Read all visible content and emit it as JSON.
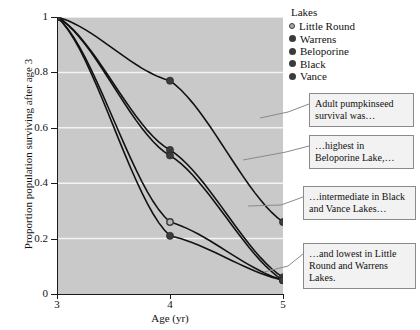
{
  "chart_data": {
    "type": "line",
    "title": "",
    "xlabel": "Age (yr)",
    "ylabel": "Proportion population surviving after age 3",
    "x": [
      3,
      4,
      5
    ],
    "xlim": [
      3,
      5
    ],
    "ylim": [
      0,
      1
    ],
    "xticks": [
      "3",
      "4",
      "5"
    ],
    "yticks": [
      "0",
      "0.2",
      "0.4",
      "0.6",
      "0.8",
      "1"
    ],
    "grid": "horizontal",
    "legend_position": "top-right",
    "legend_title": "Lakes",
    "series": [
      {
        "name": "Little Round",
        "marker": "open-circle",
        "color": "#9a9a9a",
        "values": [
          1.0,
          0.26,
          0.05
        ]
      },
      {
        "name": "Warrens",
        "marker": "filled-circle",
        "color": "#3b3b3b",
        "values": [
          1.0,
          0.21,
          0.05
        ]
      },
      {
        "name": "Beloporine",
        "marker": "filled-circle",
        "color": "#3b3b3b",
        "values": [
          1.0,
          0.77,
          0.26
        ]
      },
      {
        "name": "Black",
        "marker": "filled-circle",
        "color": "#3b3b3b",
        "values": [
          1.0,
          0.52,
          0.06
        ]
      },
      {
        "name": "Vance",
        "marker": "filled-circle",
        "color": "#3b3b3b",
        "values": [
          1.0,
          0.5,
          0.05
        ]
      }
    ],
    "annotations": [
      "Adult pumpkinseed survival was…",
      "…highest in Beloporine Lake,…",
      "…intermediate in Black and Vance Lakes…",
      "…and lowest in Little Round and Warrens Lakes."
    ]
  }
}
